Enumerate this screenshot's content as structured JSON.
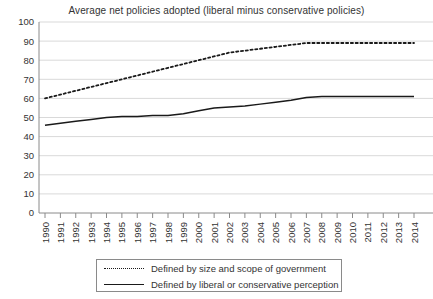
{
  "chart_data": {
    "type": "line",
    "title": "Average net policies adopted (liberal minus conservative policies)",
    "xlabel": "",
    "ylabel": "",
    "ylim": [
      0,
      100
    ],
    "ytick_step": 10,
    "yticks": [
      0,
      10,
      20,
      30,
      40,
      50,
      60,
      70,
      80,
      90,
      100
    ],
    "grid": "horizontal",
    "legend_position": "bottom",
    "categories": [
      "1990",
      "1991",
      "1992",
      "1993",
      "1994",
      "1995",
      "1996",
      "1997",
      "1998",
      "1999",
      "2000",
      "2001",
      "2002",
      "2003",
      "2004",
      "2005",
      "2006",
      "2007",
      "2008",
      "2009",
      "2010",
      "2011",
      "2012",
      "2013",
      "2014"
    ],
    "series": [
      {
        "name": "Defined by size and scope of government",
        "style": "dotted",
        "color": "#1a1a1a",
        "values": [
          60,
          62,
          64,
          66,
          68,
          70,
          72,
          74,
          76,
          78,
          80,
          82,
          84,
          85,
          86,
          87,
          88,
          89,
          89,
          89,
          89,
          89,
          89,
          89,
          89
        ]
      },
      {
        "name": "Defined by liberal or conservative perception",
        "style": "solid",
        "color": "#1a1a1a",
        "values": [
          46,
          47,
          48,
          49,
          50,
          50.5,
          50.5,
          51,
          51,
          52,
          53.5,
          55,
          55.5,
          56,
          57,
          58,
          59,
          60.5,
          61,
          61,
          61,
          61,
          61,
          61,
          61
        ]
      }
    ]
  },
  "legend": {
    "items": [
      {
        "label": "Defined by size and scope of government",
        "style": "dotted"
      },
      {
        "label": "Defined by liberal or conservative perception",
        "style": "solid"
      }
    ]
  }
}
